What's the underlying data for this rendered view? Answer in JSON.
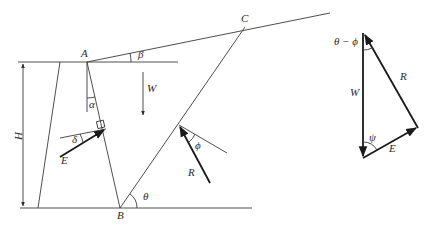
{
  "diagram": {
    "points": {
      "A": "A",
      "B": "B",
      "C": "C"
    },
    "angles": {
      "beta": "β",
      "alpha": "α",
      "delta": "δ",
      "theta": "θ",
      "phi": "ϕ",
      "psi": "ψ",
      "theta_minus_phi": "θ − ϕ"
    },
    "forces": {
      "weight": "W",
      "earth_pressure": "E",
      "reaction": "R"
    },
    "dimensions": {
      "height": "H"
    },
    "force_triangle": {
      "W_label": "W",
      "R_label": "R",
      "E_label": "E",
      "top_angle": "θ − ϕ",
      "bottom_angle": "ψ"
    },
    "colors": {
      "line": "#3a3a3a",
      "force": "#1a1a1a",
      "background": "#ffffff"
    }
  }
}
